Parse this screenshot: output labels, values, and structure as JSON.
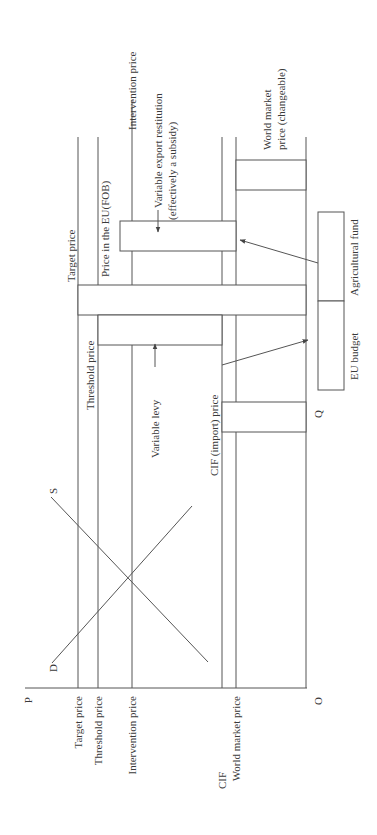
{
  "axes": {
    "y_axis_label": "P",
    "x_axis_label": "Q",
    "origin_label": "O"
  },
  "curves": {
    "supply_label": "S",
    "demand_label": "D"
  },
  "axis_price_labels": {
    "target": "Target price",
    "threshold": "Threshold price",
    "intervention": "Intervention price",
    "cif": "CIF",
    "world_market": "World market price"
  },
  "diagram_labels": {
    "target_price": "Target price",
    "threshold_price": "Threshold price",
    "price_eu_fob": "Price in the EU(FOB)",
    "intervention_price": "Intervention price",
    "variable_export_restitution_1": "Variable export restitution",
    "variable_export_restitution_2": "(effectively a subsidy)",
    "variable_levy": "Variable levy",
    "cif_import_price": "CIF (import) price",
    "world_market_price_1": "World market",
    "world_market_price_2": "price (changeable)",
    "agricultural_fund": "Agricultural fund",
    "eu_budget": "EU budget"
  },
  "colors": {
    "line": "#555555",
    "text": "#3a3a3a",
    "background": "#ffffff"
  }
}
